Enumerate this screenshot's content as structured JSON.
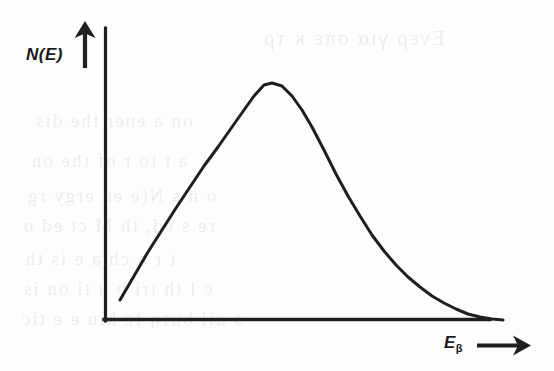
{
  "figure": {
    "kind": "line-plot",
    "y_axis_label": "N(E)",
    "x_axis_label_symbol": "E",
    "x_axis_label_subscript": "β",
    "y_axis_arrow_icon": "up-arrow-icon",
    "x_axis_arrow_icon": "right-arrow-icon",
    "ink_color": "#201f1e",
    "paper_color": "#fdfdfc",
    "bleed_color": "#3a3a38"
  },
  "background_bleed_text": [
    {
      "text": "Ενερ για  σπε κ τρ",
      "left": 262,
      "top": 26,
      "size": 21
    },
    {
      "text": "on  a   ener  the  dis",
      "left": 34,
      "top": 110,
      "size": 19
    },
    {
      "text": "a  t  to  r  of  the  on",
      "left": 30,
      "top": 150,
      "size": 19
    },
    {
      "text": "o   n  s  N(e   en  ergy  rg",
      "left": 26,
      "top": 185,
      "size": 19
    },
    {
      "text": "re   s  ed,   th  M     ct  ed  o",
      "left": 22,
      "top": 215,
      "size": 19
    },
    {
      "text": "t   r   a   ch   a    e   is  th",
      "left": 24,
      "top": 248,
      "size": 19
    },
    {
      "text": "c  l    th  tri    b  u  ti  on   is",
      "left": 22,
      "top": 278,
      "size": 19
    },
    {
      "text": "s   ɑil  buτη   fε  kin  e  e  tic",
      "left": 20,
      "top": 308,
      "size": 19
    }
  ],
  "chart_data": {
    "type": "line",
    "title": "",
    "subtitle": "",
    "xlabel": "Eβ",
    "ylabel": "N(E)",
    "grid": false,
    "legend": "none",
    "axis_style": "arrow-terminated open axes (no tick marks, no numeric scale)",
    "xlim": [
      0,
      1
    ],
    "ylim": [
      0,
      1
    ],
    "x": [
      0.07,
      0.1,
      0.14,
      0.18,
      0.22,
      0.26,
      0.3,
      0.34,
      0.38,
      0.42,
      0.46,
      0.5,
      0.54,
      0.58,
      0.62,
      0.66,
      0.7,
      0.74,
      0.78,
      0.82,
      0.86,
      0.9,
      0.94,
      0.98,
      1.0
    ],
    "y": [
      0.09,
      0.16,
      0.26,
      0.37,
      0.48,
      0.58,
      0.68,
      0.77,
      0.86,
      0.93,
      0.98,
      1.0,
      0.99,
      0.95,
      0.88,
      0.79,
      0.69,
      0.59,
      0.49,
      0.39,
      0.3,
      0.22,
      0.14,
      0.05,
      0.0
    ],
    "peak": {
      "x": 0.5,
      "y": 1.0
    },
    "endpoint": {
      "x": 1.0,
      "y": 0.0
    },
    "start": {
      "x": 0.07,
      "y": 0.09
    },
    "series": [
      {
        "name": "N(E)",
        "x": [
          0.07,
          0.1,
          0.14,
          0.18,
          0.22,
          0.26,
          0.3,
          0.34,
          0.38,
          0.42,
          0.46,
          0.5,
          0.54,
          0.58,
          0.62,
          0.66,
          0.7,
          0.74,
          0.78,
          0.82,
          0.86,
          0.9,
          0.94,
          0.98,
          1.0
        ],
        "values": [
          0.09,
          0.16,
          0.26,
          0.37,
          0.48,
          0.58,
          0.68,
          0.77,
          0.86,
          0.93,
          0.98,
          1.0,
          0.99,
          0.95,
          0.88,
          0.79,
          0.69,
          0.59,
          0.49,
          0.39,
          0.3,
          0.22,
          0.14,
          0.05,
          0.0
        ]
      }
    ],
    "pixel_path": {
      "note": "traced curve control points in screenshot pixel coordinates",
      "points": [
        [
          120,
          300
        ],
        [
          134,
          276
        ],
        [
          148,
          252
        ],
        [
          162,
          230
        ],
        [
          176,
          208
        ],
        [
          190,
          187
        ],
        [
          204,
          166
        ],
        [
          218,
          147
        ],
        [
          232,
          127
        ],
        [
          244,
          110
        ],
        [
          254,
          96
        ],
        [
          264,
          85
        ],
        [
          272,
          83
        ],
        [
          282,
          86
        ],
        [
          292,
          96
        ],
        [
          302,
          110
        ],
        [
          312,
          127
        ],
        [
          324,
          150
        ],
        [
          336,
          174
        ],
        [
          348,
          196
        ],
        [
          360,
          216
        ],
        [
          372,
          235
        ],
        [
          384,
          251
        ],
        [
          396,
          265
        ],
        [
          408,
          277
        ],
        [
          420,
          287
        ],
        [
          432,
          296
        ],
        [
          444,
          303
        ],
        [
          456,
          309
        ],
        [
          468,
          314
        ],
        [
          480,
          317
        ],
        [
          492,
          319
        ],
        [
          503,
          320
        ]
      ]
    },
    "axes_pixels": {
      "origin": [
        104,
        321
      ],
      "y_axis_top": [
        104,
        28
      ],
      "x_axis_right": [
        490,
        321
      ]
    }
  }
}
